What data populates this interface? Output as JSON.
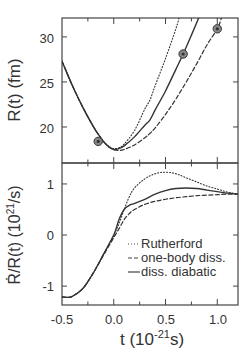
{
  "chart_data": [
    {
      "type": "line",
      "panel": "upper",
      "title": "",
      "xlabel": "",
      "ylabel": "R(t) (fm)",
      "xlim": [
        -0.5,
        1.2
      ],
      "ylim": [
        16.0,
        32.1
      ],
      "yticks": [
        20,
        25,
        30
      ],
      "ytick_labels": [
        "20",
        "25",
        "30"
      ],
      "xticks": [
        -0.5,
        -0.25,
        0.0,
        0.25,
        0.5,
        0.75,
        1.0
      ],
      "grid": false,
      "series": [
        {
          "name": "Rutherford",
          "style": "dotted",
          "x": [
            -0.5,
            -0.4,
            -0.3,
            -0.2,
            -0.15,
            -0.1,
            -0.05,
            0.0,
            0.05,
            0.1,
            0.2,
            0.3,
            0.35,
            0.4,
            0.5,
            0.6,
            0.63
          ],
          "y": [
            27.3,
            24.6,
            22.2,
            20.1,
            19.2,
            18.4,
            17.9,
            17.6,
            17.7,
            18.1,
            19.6,
            22.0,
            23.0,
            24.6,
            27.6,
            30.9,
            32.1
          ]
        },
        {
          "name": "one-body diss.",
          "style": "dashed",
          "x": [
            -0.5,
            -0.4,
            -0.3,
            -0.2,
            -0.15,
            -0.1,
            -0.05,
            0.0,
            0.05,
            0.1,
            0.2,
            0.3,
            0.35,
            0.4,
            0.5,
            0.6,
            0.7,
            0.8,
            0.9,
            1.0,
            1.04
          ],
          "y": [
            27.3,
            24.6,
            22.2,
            20.1,
            19.2,
            18.4,
            17.8,
            17.5,
            17.4,
            17.5,
            18.0,
            18.8,
            19.3,
            19.9,
            21.4,
            23.1,
            25.0,
            27.0,
            29.1,
            30.9,
            32.1
          ]
        },
        {
          "name": "diss. diabatic",
          "style": "solid",
          "x": [
            -0.5,
            -0.4,
            -0.3,
            -0.2,
            -0.15,
            -0.1,
            -0.05,
            0.0,
            0.05,
            0.1,
            0.2,
            0.3,
            0.35,
            0.4,
            0.5,
            0.6,
            0.67,
            0.75,
            0.82
          ],
          "y": [
            27.3,
            24.6,
            22.2,
            20.1,
            19.2,
            18.4,
            17.8,
            17.5,
            17.6,
            17.9,
            18.9,
            20.2,
            20.8,
            21.9,
            24.0,
            26.4,
            28.1,
            30.2,
            32.1
          ]
        }
      ],
      "markers": [
        {
          "x": -0.15,
          "y": 18.4,
          "symbol": "circled-dot"
        },
        {
          "x": 0.67,
          "y": 28.1,
          "symbol": "circled-dot"
        },
        {
          "x": 1.0,
          "y": 30.9,
          "symbol": "circled-dot"
        }
      ]
    },
    {
      "type": "line",
      "panel": "lower",
      "title": "",
      "xlabel": "t (10^-21 s)",
      "ylabel": "Ṙ/R(t) (10^21 /s)",
      "xlim": [
        -0.5,
        1.2
      ],
      "ylim": [
        -1.37,
        1.41
      ],
      "yticks": [
        -1,
        0,
        1
      ],
      "ytick_labels": [
        "-1",
        "0",
        "1"
      ],
      "xticks": [
        -0.5,
        -0.25,
        0.0,
        0.25,
        0.5,
        0.75,
        1.0
      ],
      "xtick_labels": [
        "-0.5",
        "0.0",
        "0.5",
        "1.0"
      ],
      "grid": false,
      "legend": {
        "position": "lower right",
        "entries": [
          "Rutherford",
          "one-body diss.",
          "diss. diabatic"
        ]
      },
      "series": [
        {
          "name": "Rutherford",
          "style": "dotted",
          "x": [
            -0.5,
            -0.45,
            -0.4,
            -0.3,
            -0.2,
            -0.1,
            0.0,
            0.05,
            0.1,
            0.15,
            0.2,
            0.3,
            0.4,
            0.5,
            0.6,
            0.7,
            0.8,
            0.9,
            1.0,
            1.1,
            1.2
          ],
          "y": [
            -1.21,
            -1.22,
            -1.2,
            -1.05,
            -0.75,
            -0.38,
            0.0,
            0.22,
            0.5,
            0.75,
            0.92,
            1.1,
            1.2,
            1.23,
            1.2,
            1.12,
            1.04,
            0.96,
            0.9,
            0.84,
            0.8
          ]
        },
        {
          "name": "one-body diss.",
          "style": "dashed",
          "x": [
            -0.5,
            -0.45,
            -0.4,
            -0.3,
            -0.2,
            -0.1,
            0.0,
            0.05,
            0.1,
            0.15,
            0.2,
            0.3,
            0.4,
            0.5,
            0.6,
            0.7,
            0.8,
            0.9,
            1.0,
            1.1,
            1.2
          ],
          "y": [
            -1.21,
            -1.22,
            -1.2,
            -1.05,
            -0.75,
            -0.4,
            -0.05,
            0.12,
            0.3,
            0.42,
            0.5,
            0.6,
            0.66,
            0.7,
            0.73,
            0.75,
            0.77,
            0.78,
            0.79,
            0.8,
            0.8
          ]
        },
        {
          "name": "diss. diabatic",
          "style": "solid",
          "x": [
            -0.5,
            -0.45,
            -0.4,
            -0.3,
            -0.2,
            -0.1,
            0.0,
            0.05,
            0.1,
            0.15,
            0.2,
            0.3,
            0.4,
            0.5,
            0.6,
            0.7,
            0.8,
            0.9,
            1.0,
            1.1,
            1.2
          ],
          "y": [
            -1.21,
            -1.22,
            -1.2,
            -1.05,
            -0.75,
            -0.38,
            0.0,
            0.3,
            0.5,
            0.58,
            0.62,
            0.7,
            0.8,
            0.87,
            0.91,
            0.92,
            0.91,
            0.88,
            0.85,
            0.82,
            0.8
          ]
        }
      ]
    }
  ],
  "labels": {
    "upper_ylabel": "R(t)  (fm)",
    "lower_ylabel_main": "Ṙ/R(t)  (10",
    "lower_ylabel_sup": "21",
    "lower_ylabel_tail": "/s)",
    "xlabel_main": "t  (10",
    "xlabel_sup": "-21",
    "xlabel_tail": "s)",
    "upper_yticks": [
      "30",
      "25",
      "20"
    ],
    "lower_yticks": [
      "1",
      "0",
      "-1"
    ],
    "xticks": [
      "-0.5",
      "0.0",
      "0.5",
      "1.0"
    ],
    "legend": [
      "Rutherford",
      "one-body diss.",
      "diss. diabatic"
    ]
  },
  "colors": {
    "ink": "#333333",
    "background": "#ffffff"
  }
}
